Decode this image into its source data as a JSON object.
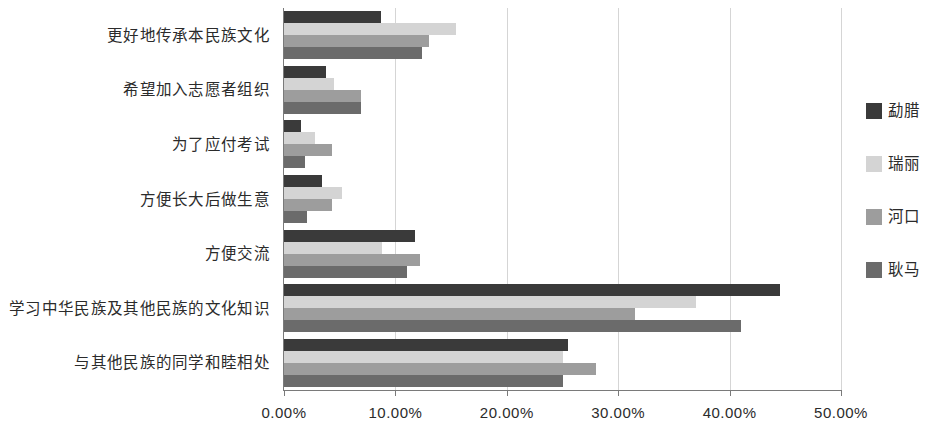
{
  "chart_data": {
    "type": "bar",
    "orientation": "horizontal",
    "title": "",
    "xlabel": "",
    "ylabel": "",
    "xlim": [
      0,
      50
    ],
    "xticks": [
      "0.00%",
      "10.00%",
      "20.00%",
      "30.00%",
      "40.00%",
      "50.00%"
    ],
    "xtick_values": [
      0,
      10,
      20,
      30,
      40,
      50
    ],
    "grid": true,
    "legend_position": "right",
    "categories": [
      "更好地传承本民族文化",
      "希望加入志愿者组织",
      "为了应付考试",
      "方便长大后做生意",
      "方便交流",
      "学习中华民族及其他民族的文化知识",
      "与其他民族的同学和睦相处"
    ],
    "series": [
      {
        "name": "勐腊",
        "color": "#3a3a3a",
        "values": [
          8.7,
          3.8,
          1.5,
          3.4,
          11.8,
          44.5,
          25.5
        ]
      },
      {
        "name": "瑞丽",
        "color": "#d4d4d4",
        "values": [
          15.4,
          4.5,
          2.8,
          5.2,
          8.8,
          37.0,
          25.0
        ]
      },
      {
        "name": "河口",
        "color": "#9d9d9d",
        "values": [
          13.0,
          6.9,
          4.3,
          4.3,
          12.2,
          31.5,
          28.0
        ]
      },
      {
        "name": "耿马",
        "color": "#6b6b6b",
        "values": [
          12.4,
          6.9,
          1.9,
          2.1,
          11.0,
          41.0,
          25.0
        ]
      }
    ]
  }
}
